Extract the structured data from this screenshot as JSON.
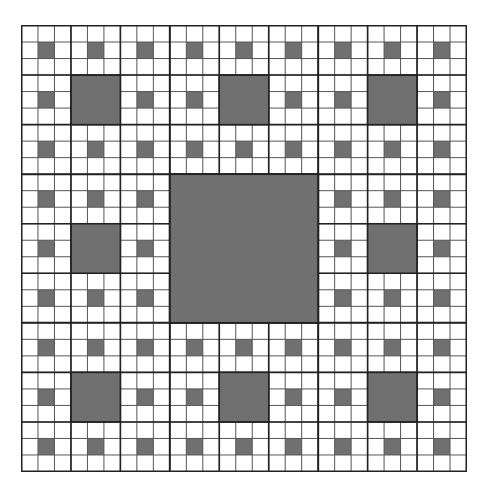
{
  "diagram": {
    "type": "sierpinski-carpet",
    "levels": 3,
    "grid_cells": 27,
    "colors": {
      "background": "#ffffff",
      "filled": "#707070",
      "thin_line": "#555555",
      "thick_line": "#222222"
    },
    "geometry": {
      "left": 21,
      "top": 25,
      "width": 445,
      "height": 446
    }
  }
}
